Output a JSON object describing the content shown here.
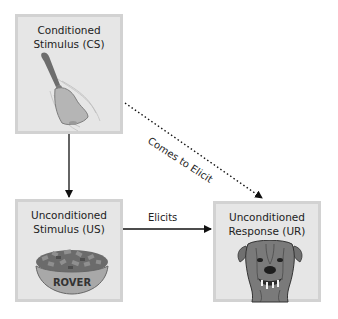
{
  "diagram": {
    "nodes": [
      {
        "id": "cs",
        "title_line1": "Conditioned",
        "title_line2": "Stimulus (CS)",
        "image": "bell-icon"
      },
      {
        "id": "us",
        "title_line1": "Unconditioned",
        "title_line2": "Stimulus (US)",
        "image": "dog-food-bowl-icon",
        "bowl_label": "ROVER"
      },
      {
        "id": "ur",
        "title_line1": "Unconditioned",
        "title_line2": "Response (UR)",
        "image": "drooling-dog-icon"
      }
    ],
    "edges": [
      {
        "from": "cs",
        "to": "us",
        "style": "solid",
        "label": ""
      },
      {
        "from": "us",
        "to": "ur",
        "style": "solid",
        "label": "Elicits"
      },
      {
        "from": "cs",
        "to": "ur",
        "style": "dotted",
        "label": "Comes to Elicit"
      }
    ]
  }
}
